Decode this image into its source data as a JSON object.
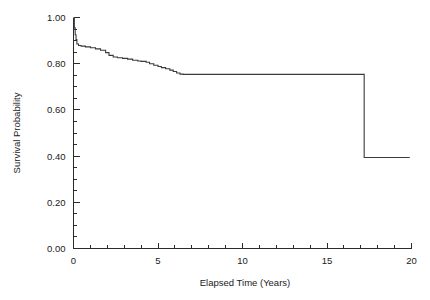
{
  "chart_data": {
    "type": "line",
    "subtype": "kaplan-meier-step",
    "title": "",
    "xlabel": "Elapsed Time (Years)",
    "ylabel": "Survival Probability",
    "xlim": [
      0,
      20
    ],
    "ylim": [
      0.0,
      1.0
    ],
    "grid": false,
    "legend": null,
    "x_ticks_major": [
      0,
      5,
      10,
      15,
      20
    ],
    "x_tick_labels": [
      "0",
      "5",
      "10",
      "15",
      "20"
    ],
    "x_tick_minor_step": 1,
    "y_ticks_major": [
      0.0,
      0.2,
      0.4,
      0.6,
      0.8,
      1.0
    ],
    "y_tick_labels": [
      "0.00",
      "0.20",
      "0.40",
      "0.60",
      "0.80",
      "1.00"
    ],
    "y_tick_minor_step": 0.05,
    "line_color": "#3a3a3a",
    "axis_color": "#2b2b2b",
    "series": [
      {
        "name": "Survival Probability",
        "x": [
          0.0,
          0.05,
          0.1,
          0.15,
          0.2,
          0.3,
          0.45,
          0.7,
          1.0,
          1.3,
          1.6,
          1.9,
          2.1,
          2.35,
          2.6,
          2.9,
          3.2,
          3.5,
          3.8,
          4.0,
          4.3,
          4.5,
          4.75,
          5.0,
          5.2,
          5.45,
          5.7,
          5.9,
          6.1,
          6.3,
          6.5,
          10.0,
          14.0,
          17.2,
          17.2,
          19.9
        ],
        "y": [
          1.0,
          0.955,
          0.925,
          0.905,
          0.885,
          0.879,
          0.876,
          0.873,
          0.869,
          0.864,
          0.858,
          0.848,
          0.836,
          0.829,
          0.826,
          0.823,
          0.82,
          0.815,
          0.812,
          0.81,
          0.806,
          0.8,
          0.793,
          0.788,
          0.783,
          0.778,
          0.772,
          0.766,
          0.76,
          0.755,
          0.754,
          0.754,
          0.754,
          0.754,
          0.394,
          0.394
        ]
      }
    ],
    "annotations": [
      {
        "label": "initial-censor-drop",
        "x": 0.2,
        "y": 0.885
      },
      {
        "label": "plateau-start",
        "x": 6.3,
        "y": 0.754
      },
      {
        "label": "terminal-event-drop",
        "x": 17.2,
        "y": 0.394
      }
    ]
  },
  "axes": {
    "x_title": "Elapsed Time (Years)",
    "y_title": "Survival Probability"
  }
}
